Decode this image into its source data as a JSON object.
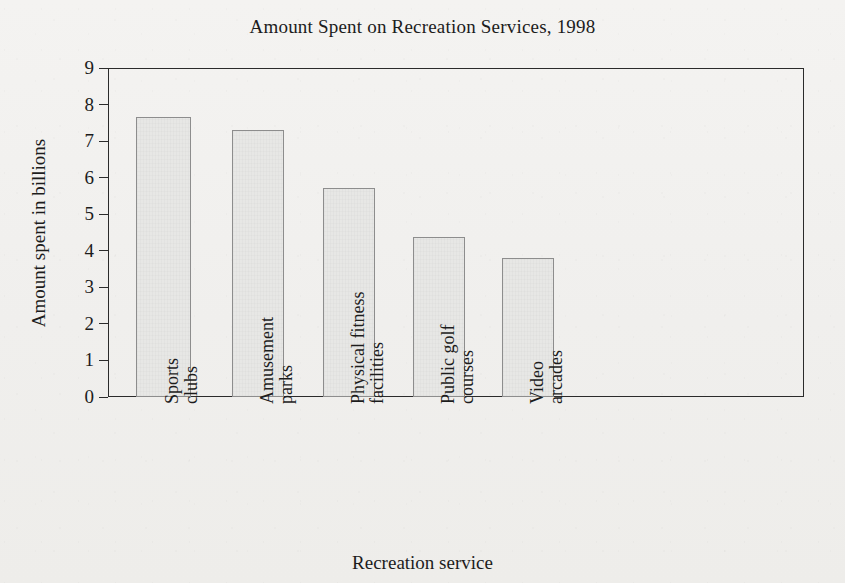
{
  "chart_data": {
    "type": "bar",
    "title": "Amount Spent on Recreation Services, 1998",
    "xlabel": "Recreation service",
    "ylabel": "Amount spent in billions",
    "categories": [
      "Sports clubs",
      "Amusement parks",
      "Physical fitness facilities",
      "Public golf courses",
      "Video arcades"
    ],
    "category_lines": [
      [
        "Sports",
        "clubs"
      ],
      [
        "Amusement",
        "parks"
      ],
      [
        "Physical fitness",
        "facilities"
      ],
      [
        "Public golf",
        "courses"
      ],
      [
        "Video",
        "arcades"
      ]
    ],
    "values": [
      7.65,
      7.3,
      5.72,
      4.37,
      3.8
    ],
    "ylim": [
      0,
      9
    ],
    "yticks": [
      0,
      1,
      2,
      3,
      4,
      5,
      6,
      7,
      8,
      9
    ],
    "ytick_labels": [
      "0",
      "1",
      "2",
      "3",
      "4",
      "5",
      "6",
      "7",
      "8",
      "9"
    ],
    "grid": false,
    "legend": null,
    "bar_fill_color": "#e7e7e5",
    "bar_border_color": "#8d8d8d",
    "axis_color": "#2b2b2b",
    "background_color": "#f2f1ef"
  }
}
